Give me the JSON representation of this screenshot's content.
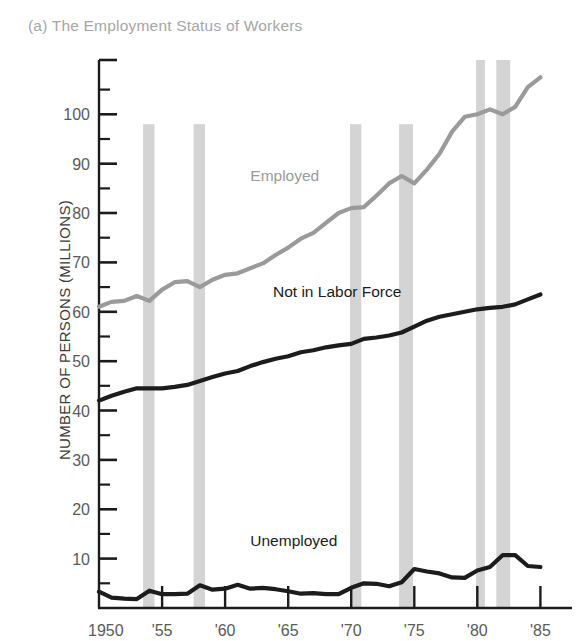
{
  "chart_data": {
    "type": "line",
    "title": "(a) The Employment Status of Workers",
    "xlabel": "",
    "ylabel": "NUMBER OF PERSONS (MILLIONS)",
    "xlim": [
      1950,
      1986
    ],
    "ylim": [
      0,
      111
    ],
    "grid": false,
    "legend_position": "inline-annotations",
    "x_tick_labels": [
      "1950",
      "'55",
      "'60",
      "'65",
      "'70",
      "'75",
      "'80",
      "'85"
    ],
    "x_tick_values": [
      1950,
      1955,
      1960,
      1965,
      1970,
      1975,
      1980,
      1985
    ],
    "y_tick_labels": [
      "10",
      "20",
      "30",
      "40",
      "50",
      "60",
      "70",
      "80",
      "90",
      "100"
    ],
    "y_tick_values": [
      10,
      20,
      30,
      40,
      50,
      60,
      70,
      80,
      90,
      100
    ],
    "y_minor_tick_values": [
      5,
      15,
      25,
      35,
      45,
      55,
      65,
      75,
      85,
      95,
      105
    ],
    "x": [
      1950,
      1951,
      1952,
      1953,
      1954,
      1955,
      1956,
      1957,
      1958,
      1959,
      1960,
      1961,
      1962,
      1963,
      1964,
      1965,
      1966,
      1967,
      1968,
      1969,
      1970,
      1971,
      1972,
      1973,
      1974,
      1975,
      1976,
      1977,
      1978,
      1979,
      1980,
      1981,
      1982,
      1983,
      1984,
      1985
    ],
    "series": [
      {
        "name": "Employed",
        "color": "#9a9a9a",
        "label_color": "#9a9a9a",
        "label_x": 1962.0,
        "label_y": 86.5,
        "values": [
          61.0,
          62.0,
          62.2,
          63.2,
          62.2,
          64.5,
          66.0,
          66.2,
          65.0,
          66.5,
          67.5,
          67.8,
          68.8,
          69.8,
          71.5,
          73.0,
          74.8,
          76.0,
          78.0,
          80.0,
          81.0,
          81.2,
          83.5,
          86.0,
          87.5,
          86.0,
          88.8,
          92.0,
          96.5,
          99.5,
          100.0,
          101.0,
          100.0,
          101.5,
          105.5,
          107.5
        ]
      },
      {
        "name": "Not in Labor Force",
        "color": "#1c1c1c",
        "label_color": "#1c1c1c",
        "label_x": 1963.8,
        "label_y": 63.0,
        "values": [
          42.0,
          43.0,
          43.8,
          44.5,
          44.5,
          44.5,
          44.8,
          45.2,
          46.0,
          46.8,
          47.5,
          48.0,
          49.0,
          49.8,
          50.5,
          51.0,
          51.8,
          52.2,
          52.8,
          53.2,
          53.5,
          54.5,
          54.8,
          55.2,
          55.8,
          57.0,
          58.2,
          59.0,
          59.5,
          60.0,
          60.5,
          60.8,
          61.0,
          61.5,
          62.5,
          63.5
        ]
      },
      {
        "name": "Unemployed",
        "color": "#1c1c1c",
        "label_color": "#1c1c1c",
        "label_x": 1962.0,
        "label_y": 12.5,
        "values": [
          3.3,
          2.1,
          1.9,
          1.8,
          3.5,
          2.8,
          2.8,
          2.9,
          4.6,
          3.7,
          3.9,
          4.7,
          3.9,
          4.1,
          3.8,
          3.4,
          2.9,
          3.0,
          2.8,
          2.8,
          4.1,
          5.0,
          4.9,
          4.4,
          5.2,
          7.9,
          7.4,
          7.0,
          6.2,
          6.1,
          7.6,
          8.3,
          10.7,
          10.7,
          8.5,
          8.3
        ]
      }
    ],
    "recession_bands": [
      {
        "start": 1953.5,
        "end": 1954.4,
        "top_value": 98.0
      },
      {
        "start": 1957.5,
        "end": 1958.4,
        "top_value": 98.0
      },
      {
        "start": 1969.9,
        "end": 1970.8,
        "top_value": 98.0
      },
      {
        "start": 1973.8,
        "end": 1974.9,
        "top_value": 98.0
      },
      {
        "start": 1979.9,
        "end": 1980.6,
        "top_value": 111.0
      },
      {
        "start": 1981.5,
        "end": 1982.6,
        "top_value": 111.0
      }
    ],
    "recession_band_color": "#d4d4d4"
  }
}
